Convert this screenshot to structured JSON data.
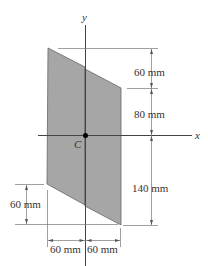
{
  "diagram": {
    "type": "cross-section area with centroid",
    "axes": {
      "x_label": "x",
      "y_label": "y"
    },
    "centroid_label": "C",
    "dimensions": {
      "right_top": "60 mm",
      "right_middle": "80 mm",
      "right_bottom": "140 mm",
      "left_bottom": "60 mm",
      "bottom_left": "60 mm",
      "bottom_right": "60 mm"
    },
    "colors": {
      "fill": "#a6a6a6",
      "line": "#555555",
      "axis": "#444444"
    }
  }
}
